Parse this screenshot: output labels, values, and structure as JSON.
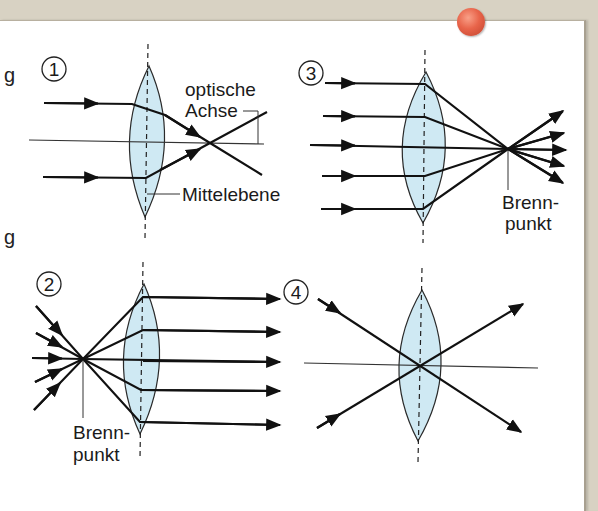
{
  "figure": {
    "panels": [
      {
        "number": "1",
        "labels": {
          "optical_axis": [
            "optische",
            "Achse"
          ],
          "center_plane": "Mittelebene"
        }
      },
      {
        "number": "2",
        "labels": {
          "focal_point": [
            "Brenn-",
            "punkt"
          ]
        }
      },
      {
        "number": "3",
        "labels": {
          "focal_point": [
            "Brenn-",
            "punkt"
          ]
        }
      },
      {
        "number": "4",
        "labels": {}
      }
    ],
    "colors": {
      "lens_fill": "#cfe9f3",
      "lens_stroke": "#2a2a2a",
      "ray": "#111111",
      "pin": "#e8644a",
      "paper": "#ffffff",
      "board": "#d8d2c3"
    },
    "edge_fragments": [
      "g",
      "g"
    ]
  }
}
